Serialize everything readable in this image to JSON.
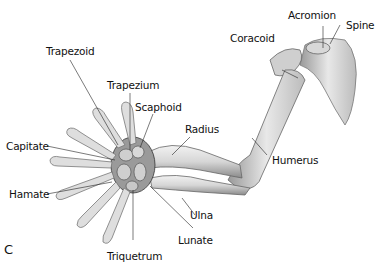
{
  "figure": {
    "panel_letter": "C",
    "labels": {
      "trapezoid": "Trapezoid",
      "trapezium": "Trapezium",
      "scaphoid": "Scaphoid",
      "capitate": "Capitate",
      "hamate": "Hamate",
      "triquetrum": "Triquetrum",
      "lunate": "Lunate",
      "ulna": "Ulna",
      "radius": "Radius",
      "humerus": "Humerus",
      "coracoid": "Coracoid",
      "acromion": "Acromion",
      "spine": "Spine"
    }
  }
}
